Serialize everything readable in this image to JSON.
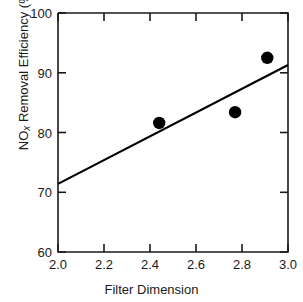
{
  "chart_data": {
    "type": "scatter",
    "title": "",
    "xlabel": "Filter Dimension",
    "ylabel_prefix": "NO",
    "ylabel_subscript": "x",
    "ylabel_suffix": " Removal Efficiency (%)",
    "ylabel": "NOx Removal Efficiency (%)",
    "xlim": [
      2.0,
      3.0
    ],
    "ylim": [
      60,
      100
    ],
    "xticks": [
      "2.0",
      "2.2",
      "2.4",
      "2.6",
      "2.8",
      "3.0"
    ],
    "xtick_values": [
      2.0,
      2.2,
      2.4,
      2.6,
      2.8,
      3.0
    ],
    "yticks": [
      "60",
      "70",
      "80",
      "90",
      "100"
    ],
    "ytick_values": [
      60,
      70,
      80,
      90,
      100
    ],
    "grid": false,
    "legend": "none",
    "marker_color": "#000000",
    "line_color": "#000000",
    "axis_color": "#1a1a1a",
    "background": "#ffffff",
    "series": [
      {
        "name": "Measured points",
        "type": "scatter",
        "marker": "filled-circle",
        "x": [
          2.44,
          2.77,
          2.91
        ],
        "y": [
          81.6,
          83.4,
          92.5
        ]
      },
      {
        "name": "Linear fit",
        "type": "line",
        "x": [
          2.0,
          3.0
        ],
        "y": [
          71.4,
          91.3
        ]
      }
    ]
  }
}
